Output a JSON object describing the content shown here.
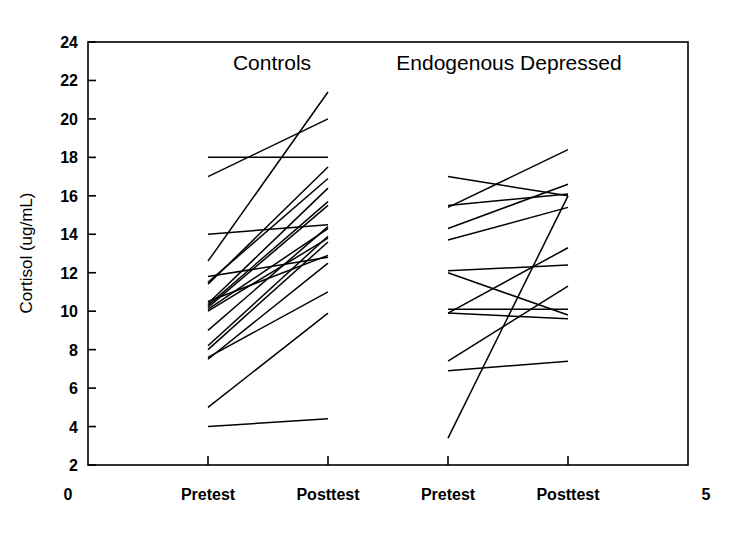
{
  "chart_data": {
    "type": "line",
    "title": "",
    "subtitle": "",
    "xlabel": "",
    "ylabel": "Cortisol (ug/mL)",
    "ylim": [
      2,
      24
    ],
    "yticks": [
      2,
      4,
      6,
      8,
      10,
      12,
      14,
      16,
      18,
      20,
      22,
      24
    ],
    "ytick_labels": [
      "2",
      "4",
      "6",
      "8",
      "10",
      "12",
      "14",
      "16",
      "18",
      "20",
      "22",
      "24"
    ],
    "xlim": [
      0,
      5
    ],
    "xticks": [
      1,
      2,
      3,
      4
    ],
    "xtick_labels": [
      "Pretest",
      "Posttest",
      "Pretest",
      "Posttest"
    ],
    "x_axis_end_labels": {
      "left": "0",
      "right": "5"
    },
    "grid": false,
    "legend": false,
    "legend_position": "none",
    "annotations": [
      {
        "text": "Controls",
        "x": 1.5,
        "y": 22.6
      },
      {
        "text": "Endogenous Depressed",
        "x": 3.5,
        "y": 22.6
      }
    ],
    "groups": [
      {
        "name": "Controls",
        "x_positions": [
          1,
          2
        ],
        "x_labels": [
          "Pretest",
          "Posttest"
        ],
        "series": [
          {
            "name": "C1",
            "values": [
              17.0,
              20.0
            ]
          },
          {
            "name": "C2",
            "values": [
              18.0,
              18.0
            ]
          },
          {
            "name": "C3",
            "values": [
              12.6,
              21.4
            ]
          },
          {
            "name": "C4",
            "values": [
              14.0,
              14.5
            ]
          },
          {
            "name": "C5",
            "values": [
              11.4,
              17.5
            ]
          },
          {
            "name": "C6",
            "values": [
              11.5,
              16.9
            ]
          },
          {
            "name": "C7",
            "values": [
              10.4,
              16.4
            ]
          },
          {
            "name": "C8",
            "values": [
              10.3,
              15.7
            ]
          },
          {
            "name": "C9",
            "values": [
              10.2,
              15.5
            ]
          },
          {
            "name": "C10",
            "values": [
              10.1,
              14.3
            ]
          },
          {
            "name": "C11",
            "values": [
              9.0,
              14.4
            ]
          },
          {
            "name": "C12",
            "values": [
              10.0,
              13.8
            ]
          },
          {
            "name": "C13",
            "values": [
              8.2,
              13.9
            ]
          },
          {
            "name": "C14",
            "values": [
              8.0,
              13.6
            ]
          },
          {
            "name": "C15",
            "values": [
              10.5,
              12.9
            ]
          },
          {
            "name": "C16",
            "values": [
              11.8,
              12.8
            ]
          },
          {
            "name": "C17",
            "values": [
              7.5,
              12.5
            ]
          },
          {
            "name": "C18",
            "values": [
              7.6,
              11.0
            ]
          },
          {
            "name": "C19",
            "values": [
              5.0,
              9.9
            ]
          },
          {
            "name": "C20",
            "values": [
              4.0,
              4.4
            ]
          }
        ]
      },
      {
        "name": "Endogenous Depressed",
        "x_positions": [
          3,
          4
        ],
        "x_labels": [
          "Pretest",
          "Posttest"
        ],
        "series": [
          {
            "name": "E1",
            "values": [
              15.4,
              18.4
            ]
          },
          {
            "name": "E2",
            "values": [
              17.0,
              16.0
            ]
          },
          {
            "name": "E3",
            "values": [
              14.3,
              16.6
            ]
          },
          {
            "name": "E4",
            "values": [
              15.5,
              16.1
            ]
          },
          {
            "name": "E5",
            "values": [
              13.7,
              15.4
            ]
          },
          {
            "name": "E6",
            "values": [
              12.1,
              12.4
            ]
          },
          {
            "name": "E7",
            "values": [
              12.0,
              9.8
            ]
          },
          {
            "name": "E8",
            "values": [
              9.9,
              13.3
            ]
          },
          {
            "name": "E9",
            "values": [
              10.1,
              10.1
            ]
          },
          {
            "name": "E10",
            "values": [
              9.9,
              9.6
            ]
          },
          {
            "name": "E11",
            "values": [
              7.4,
              11.3
            ]
          },
          {
            "name": "E12",
            "values": [
              6.9,
              7.4
            ]
          },
          {
            "name": "E13",
            "values": [
              3.4,
              16.0
            ]
          }
        ]
      }
    ]
  },
  "figure": {
    "y_axis_label": "Cortisol (ug/mL)",
    "x_left_end_label": "0",
    "x_right_end_label": "5",
    "group_label_left": "Controls",
    "group_label_right": "Endogenous Depressed",
    "line_color": "#000000",
    "axis_color": "#000000",
    "background_color": "#ffffff"
  }
}
